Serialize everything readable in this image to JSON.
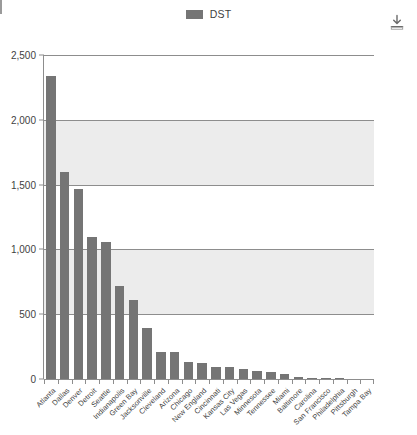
{
  "legend": {
    "items": [
      {
        "label": "DST",
        "color": "#757575"
      }
    ]
  },
  "toolbar": {
    "download_icon": "download-icon",
    "download_label": "Download"
  },
  "chart_data": {
    "type": "bar",
    "title": "",
    "subtitle": "",
    "xlabel": "",
    "ylabel": "",
    "ylim": [
      0,
      2500
    ],
    "yticks": [
      0,
      500,
      1000,
      1500,
      2000,
      2500
    ],
    "ytick_labels": [
      "0",
      "500",
      "1,000",
      "1,500",
      "2,000",
      "2,500"
    ],
    "grid": true,
    "legend_position": "top-center",
    "series_name": "DST",
    "series_color": "#757575",
    "categories": [
      "Atlanta",
      "Dallas",
      "Denver",
      "Detroit",
      "Seattle",
      "Indianapolis",
      "Green Bay",
      "Jacksonville",
      "Cleveland",
      "Arizona",
      "Chicago",
      "New England",
      "Cincinnati",
      "Kansas City",
      "Las Vegas",
      "Minnesota",
      "Tennessee",
      "Miami",
      "Baltimore",
      "Carolina",
      "San Francisco",
      "Philadelphia",
      "Pittsburgh",
      "Tampa Bay"
    ],
    "values": [
      2340,
      1595,
      1470,
      1095,
      1055,
      720,
      610,
      395,
      210,
      205,
      130,
      125,
      95,
      90,
      75,
      60,
      55,
      40,
      15,
      10,
      6,
      4,
      3,
      2
    ]
  }
}
